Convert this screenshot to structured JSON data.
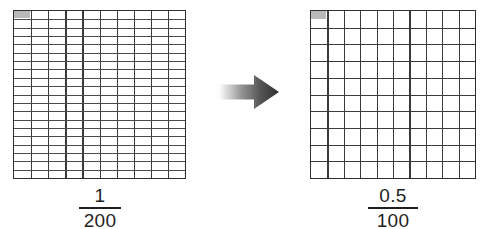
{
  "figure": {
    "background_color": "#ffffff",
    "grid_line_color": "#3a3a3a",
    "shade_color": "#b9b9b9",
    "text_color": "#1f1f1f"
  },
  "left_panel": {
    "name": "left-grid-panel",
    "grid": {
      "columns": 10,
      "rows": 20,
      "total_cells": 200,
      "shaded_cells": 1,
      "shaded_fraction_of_cell": 1,
      "shaded_position": "top-left"
    },
    "label": {
      "numerator": "1",
      "denominator": "200",
      "value": "1/200"
    }
  },
  "arrow": {
    "name": "transformation-arrow",
    "direction": "right",
    "gradient_from": "#f2f2f2",
    "gradient_to": "#3d3d3d"
  },
  "right_panel": {
    "name": "right-grid-panel",
    "grid": {
      "columns": 10,
      "rows": 10,
      "total_cells": 100,
      "shaded_cells": 1,
      "shaded_fraction_of_cell": 0.5,
      "shaded_position": "top-left"
    },
    "label": {
      "numerator": "0.5",
      "denominator": "100",
      "value": "0.5/100"
    }
  },
  "chart_data": {
    "type": "table",
    "categories": [
      "1/200",
      "0.5/100"
    ],
    "values": [
      0.005,
      0.005
    ],
    "series": [
      {
        "name": "grid columns",
        "values": [
          10,
          10
        ]
      },
      {
        "name": "grid rows",
        "values": [
          20,
          10
        ]
      },
      {
        "name": "total cells",
        "values": [
          200,
          100
        ]
      },
      {
        "name": "shaded area (cells)",
        "values": [
          1,
          0.5
        ]
      }
    ],
    "xlabel": "",
    "ylabel": "",
    "grid": true,
    "legend": "none"
  }
}
